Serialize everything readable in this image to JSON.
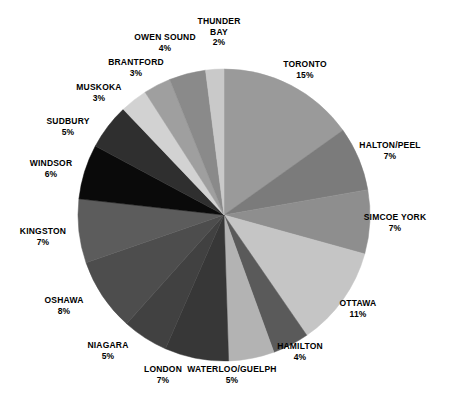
{
  "chart_data": {
    "type": "pie",
    "title": "",
    "subtitle": "",
    "xlabel": "",
    "ylabel": "",
    "legend_position": "none",
    "grid": false,
    "units": "percent",
    "start_angle_deg": 0,
    "direction": "clockwise",
    "categories": [
      "TORONTO",
      "HALTON/PEEL",
      "SIMCOE YORK",
      "OTTAWA",
      "HAMILTON",
      "WATERLOO/GUELPH",
      "LONDON",
      "NIAGARA",
      "OSHAWA",
      "KINGSTON",
      "WINDSOR",
      "SUDBURY",
      "MUSKOKA",
      "BRANTFORD",
      "OWEN SOUND",
      "THUNDER BAY"
    ],
    "values": [
      15,
      7,
      7,
      11,
      4,
      5,
      7,
      5,
      8,
      7,
      6,
      5,
      3,
      3,
      4,
      2
    ],
    "colors": [
      "#9a9a9a",
      "#7b7b7b",
      "#8e8e8e",
      "#c5c5c5",
      "#5a5a5a",
      "#b3b3b3",
      "#373737",
      "#414141",
      "#4d4d4d",
      "#5c5c5c",
      "#0a0a0a",
      "#2f2f2f",
      "#d2d2d2",
      "#9f9f9f",
      "#8a8a8a",
      "#c9c9c9"
    ],
    "slices": [
      {
        "label": "TORONTO",
        "value": 15,
        "value_text": "15%",
        "color": "#9a9a9a"
      },
      {
        "label": "HALTON/PEEL",
        "value": 7,
        "value_text": "7%",
        "color": "#7b7b7b"
      },
      {
        "label": "SIMCOE YORK",
        "value": 7,
        "value_text": "7%",
        "color": "#8e8e8e"
      },
      {
        "label": "OTTAWA",
        "value": 11,
        "value_text": "11%",
        "color": "#c5c5c5"
      },
      {
        "label": "HAMILTON",
        "value": 4,
        "value_text": "4%",
        "color": "#5a5a5a"
      },
      {
        "label": "WATERLOO/GUELPH",
        "value": 5,
        "value_text": "5%",
        "color": "#b3b3b3"
      },
      {
        "label": "LONDON",
        "value": 7,
        "value_text": "7%",
        "color": "#373737"
      },
      {
        "label": "NIAGARA",
        "value": 5,
        "value_text": "5%",
        "color": "#414141"
      },
      {
        "label": "OSHAWA",
        "value": 8,
        "value_text": "8%",
        "color": "#4d4d4d"
      },
      {
        "label": "KINGSTON",
        "value": 7,
        "value_text": "7%",
        "color": "#5c5c5c"
      },
      {
        "label": "WINDSOR",
        "value": 6,
        "value_text": "6%",
        "color": "#0a0a0a"
      },
      {
        "label": "SUDBURY",
        "value": 5,
        "value_text": "5%",
        "color": "#2f2f2f"
      },
      {
        "label": "MUSKOKA",
        "value": 3,
        "value_text": "3%",
        "color": "#d2d2d2"
      },
      {
        "label": "BRANTFORD",
        "value": 3,
        "value_text": "3%",
        "color": "#9f9f9f"
      },
      {
        "label": "OWEN SOUND",
        "value": 4,
        "value_text": "4%",
        "color": "#8a8a8a"
      },
      {
        "label": "THUNDER BAY",
        "value": 2,
        "value_text": "2%",
        "color": "#c9c9c9"
      }
    ]
  },
  "labels": [
    {
      "name": "TORONTO",
      "value_text": "15%",
      "x": 305,
      "y": 69,
      "wrap": false
    },
    {
      "name": "HALTON/PEEL",
      "value_text": "7%",
      "x": 390,
      "y": 150,
      "wrap": false
    },
    {
      "name": "SIMCOE YORK",
      "value_text": "7%",
      "x": 395,
      "y": 222,
      "wrap": false
    },
    {
      "name": "OTTAWA",
      "value_text": "11%",
      "x": 358,
      "y": 308,
      "wrap": false
    },
    {
      "name": "HAMILTON",
      "value_text": "4%",
      "x": 300,
      "y": 351,
      "wrap": false
    },
    {
      "name": "WATERLOO/GUELPH",
      "value_text": "5%",
      "x": 232,
      "y": 374,
      "wrap": false
    },
    {
      "name": "LONDON",
      "value_text": "7%",
      "x": 163,
      "y": 374,
      "wrap": false
    },
    {
      "name": "NIAGARA",
      "value_text": "5%",
      "x": 108,
      "y": 350,
      "wrap": false
    },
    {
      "name": "OSHAWA",
      "value_text": "8%",
      "x": 64,
      "y": 305,
      "wrap": false
    },
    {
      "name": "KINGSTON",
      "value_text": "7%",
      "x": 43,
      "y": 236,
      "wrap": false
    },
    {
      "name": "WINDSOR",
      "value_text": "6%",
      "x": 51,
      "y": 168,
      "wrap": false
    },
    {
      "name": "SUDBURY",
      "value_text": "5%",
      "x": 68,
      "y": 126,
      "wrap": false
    },
    {
      "name": "MUSKOKA",
      "value_text": "3%",
      "x": 99,
      "y": 92,
      "wrap": false
    },
    {
      "name": "BRANTFORD",
      "value_text": "3%",
      "x": 136,
      "y": 67,
      "wrap": false
    },
    {
      "name": "OWEN SOUND",
      "value_text": "4%",
      "x": 165,
      "y": 42,
      "wrap": false
    },
    {
      "name": "THUNDER BAY",
      "value_text": "2%",
      "x": 219,
      "y": 32,
      "wrap": true
    }
  ],
  "geometry": {
    "cx": 224,
    "cy": 215,
    "r": 146
  }
}
